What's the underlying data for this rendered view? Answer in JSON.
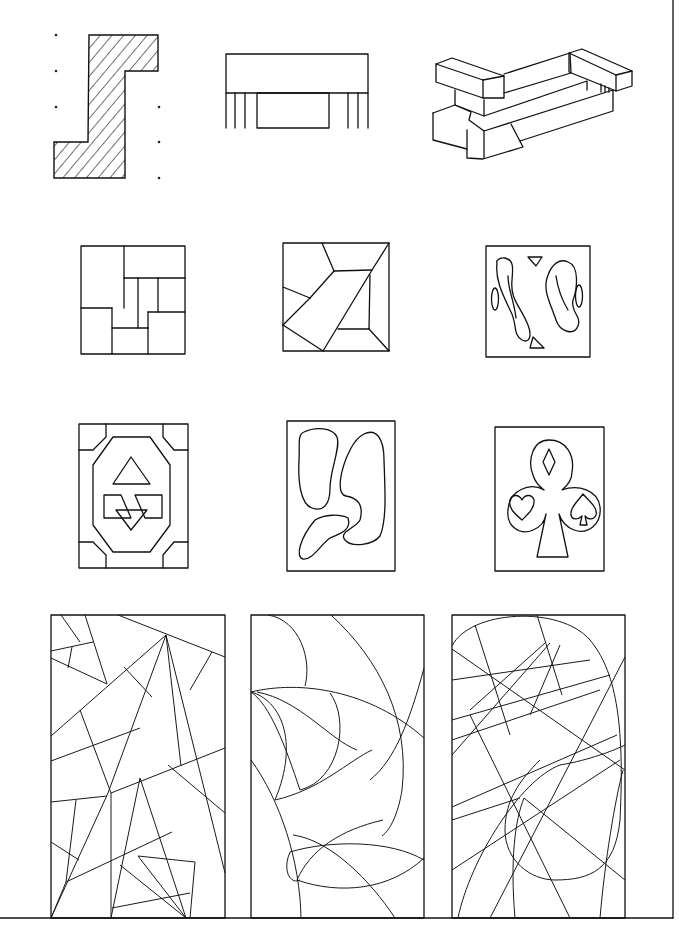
{
  "page": {
    "background": "#ffffff",
    "stroke_color": "#111111",
    "border": {
      "right_x": 673,
      "bottom_y": 918
    }
  },
  "rows": [
    {
      "name": "row-1",
      "items": [
        "hatched-stepped-section",
        "bar-with-legs-elevation",
        "isometric-interlocking-blocks"
      ]
    },
    {
      "name": "row-2",
      "items": [
        "rectangle-panel-pattern",
        "angular-trapezoid-pattern",
        "swirl-motif-pattern"
      ]
    },
    {
      "name": "row-3",
      "items": [
        "octagon-triangles-pattern",
        "organic-blob-pattern",
        "card-suit-club-pattern"
      ]
    },
    {
      "name": "row-4",
      "items": [
        "straight-line-fracture-panel",
        "curved-arc-panel",
        "oval-and-lines-panel"
      ]
    }
  ]
}
